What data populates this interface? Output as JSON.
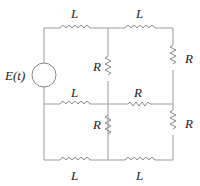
{
  "diagram": {
    "type": "circuit",
    "source": {
      "label": "E(t)"
    },
    "components": [
      {
        "id": "L-top-left",
        "type": "inductor",
        "label": "L"
      },
      {
        "id": "L-top-right",
        "type": "inductor",
        "label": "L"
      },
      {
        "id": "R-mid-upper",
        "type": "resistor",
        "label": "R"
      },
      {
        "id": "R-right-upper",
        "type": "resistor",
        "label": "R"
      },
      {
        "id": "L-mid-left",
        "type": "inductor",
        "label": "L"
      },
      {
        "id": "R-mid-right",
        "type": "resistor",
        "label": "R"
      },
      {
        "id": "R-mid-lower",
        "type": "resistor",
        "label": "R"
      },
      {
        "id": "R-right-lower",
        "type": "resistor",
        "label": "R"
      },
      {
        "id": "L-bottom-left",
        "type": "inductor",
        "label": "L"
      },
      {
        "id": "L-bottom-right",
        "type": "inductor",
        "label": "L"
      }
    ]
  }
}
